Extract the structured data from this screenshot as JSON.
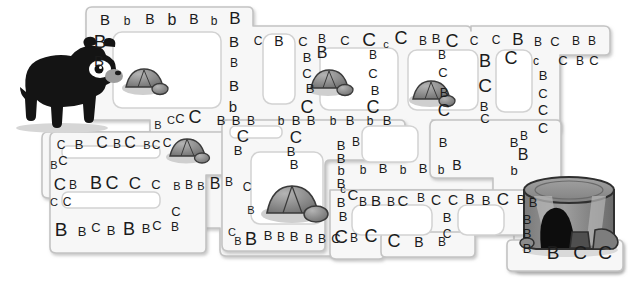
{
  "page": {
    "background_color": "#ffffff",
    "path_fill": "#f7f7f7",
    "path_stroke": "#bdbdbd",
    "letter_color": "#1b1b1b"
  },
  "figures": {
    "bear": {
      "name": "black-bear",
      "alt": "Black bear standing at the maze entrance on the left",
      "body_color": "#1a1a1a",
      "muzzle_color": "#9a9a9a",
      "shadow_color": "#cfcfcf"
    },
    "stump": {
      "name": "tree-stump-den",
      "alt": "Hollow tree stump den at the maze exit on the right",
      "top_color": "#8f8f8f",
      "side_color": "#6e6e6e",
      "hollow_color": "#111111",
      "light_color": "#b5b5b5"
    },
    "rocks": [
      {
        "name": "rock-1",
        "x": 126,
        "y": 70,
        "w": 40,
        "h": 26
      },
      {
        "name": "rock-2",
        "x": 170,
        "y": 138,
        "w": 38,
        "h": 25
      },
      {
        "name": "rock-3",
        "x": 311,
        "y": 70,
        "w": 40,
        "h": 27
      },
      {
        "name": "rock-4",
        "x": 413,
        "y": 81,
        "w": 40,
        "h": 27
      },
      {
        "name": "rock-5",
        "x": 268,
        "y": 180,
        "w": 58,
        "h": 39
      }
    ]
  },
  "letters": [
    {
      "t": "B",
      "x": 105,
      "y": 19,
      "s": 15
    },
    {
      "t": "b",
      "x": 127,
      "y": 21,
      "s": 12
    },
    {
      "t": "B",
      "x": 150,
      "y": 19,
      "s": 14
    },
    {
      "t": "b",
      "x": 172,
      "y": 20,
      "s": 16
    },
    {
      "t": "B",
      "x": 194,
      "y": 19,
      "s": 14
    },
    {
      "t": "b",
      "x": 214,
      "y": 21,
      "s": 12
    },
    {
      "t": "B",
      "x": 235,
      "y": 18,
      "s": 17
    },
    {
      "t": "B",
      "x": 100,
      "y": 41,
      "s": 19
    },
    {
      "t": "B",
      "x": 99,
      "y": 60,
      "s": 15
    },
    {
      "t": "B",
      "x": 234,
      "y": 41,
      "s": 15
    },
    {
      "t": "B",
      "x": 234,
      "y": 63,
      "s": 12
    },
    {
      "t": "B",
      "x": 234,
      "y": 85,
      "s": 15
    },
    {
      "t": "b",
      "x": 233,
      "y": 106,
      "s": 15
    },
    {
      "t": "C",
      "x": 258,
      "y": 41,
      "s": 12
    },
    {
      "t": "B",
      "x": 279,
      "y": 41,
      "s": 14
    },
    {
      "t": "C",
      "x": 303,
      "y": 41,
      "s": 13
    },
    {
      "t": "B",
      "x": 322,
      "y": 39,
      "s": 12
    },
    {
      "t": "B",
      "x": 322,
      "y": 53,
      "s": 16
    },
    {
      "t": "C",
      "x": 345,
      "y": 40,
      "s": 13
    },
    {
      "t": "C",
      "x": 369,
      "y": 39,
      "s": 19
    },
    {
      "t": "c",
      "x": 386,
      "y": 44,
      "s": 11
    },
    {
      "t": "C",
      "x": 401,
      "y": 38,
      "s": 18
    },
    {
      "t": "B",
      "x": 423,
      "y": 41,
      "s": 12
    },
    {
      "t": "B",
      "x": 436,
      "y": 38,
      "s": 13
    },
    {
      "t": "C",
      "x": 452,
      "y": 41,
      "s": 18
    },
    {
      "t": "B",
      "x": 442,
      "y": 55,
      "s": 12
    },
    {
      "t": "C",
      "x": 443,
      "y": 72,
      "s": 13
    },
    {
      "t": "B",
      "x": 444,
      "y": 92,
      "s": 13
    },
    {
      "t": "C",
      "x": 444,
      "y": 110,
      "s": 17
    },
    {
      "t": "C",
      "x": 474,
      "y": 41,
      "s": 12
    },
    {
      "t": "C",
      "x": 496,
      "y": 40,
      "s": 12
    },
    {
      "t": "B",
      "x": 518,
      "y": 39,
      "s": 17
    },
    {
      "t": "B",
      "x": 538,
      "y": 42,
      "s": 12
    },
    {
      "t": "C",
      "x": 555,
      "y": 41,
      "s": 13
    },
    {
      "t": "B",
      "x": 576,
      "y": 41,
      "s": 12
    },
    {
      "t": "B",
      "x": 592,
      "y": 41,
      "s": 12
    },
    {
      "t": "B",
      "x": 485,
      "y": 61,
      "s": 18
    },
    {
      "t": "C",
      "x": 511,
      "y": 58,
      "s": 18
    },
    {
      "t": "c",
      "x": 536,
      "y": 61,
      "s": 12
    },
    {
      "t": "C",
      "x": 563,
      "y": 60,
      "s": 13
    },
    {
      "t": "B",
      "x": 580,
      "y": 61,
      "s": 12
    },
    {
      "t": "C",
      "x": 594,
      "y": 60,
      "s": 13
    },
    {
      "t": "C",
      "x": 485,
      "y": 85,
      "s": 19
    },
    {
      "t": "B",
      "x": 484,
      "y": 106,
      "s": 13
    },
    {
      "t": "C",
      "x": 485,
      "y": 118,
      "s": 13
    },
    {
      "t": "B",
      "x": 543,
      "y": 75,
      "s": 13
    },
    {
      "t": "C",
      "x": 543,
      "y": 93,
      "s": 13
    },
    {
      "t": "C",
      "x": 543,
      "y": 110,
      "s": 14
    },
    {
      "t": "C",
      "x": 543,
      "y": 128,
      "s": 14
    },
    {
      "t": "B",
      "x": 307,
      "y": 57,
      "s": 13
    },
    {
      "t": "C",
      "x": 307,
      "y": 73,
      "s": 13
    },
    {
      "t": "B",
      "x": 310,
      "y": 88,
      "s": 13
    },
    {
      "t": "C",
      "x": 307,
      "y": 107,
      "s": 18
    },
    {
      "t": "B",
      "x": 373,
      "y": 55,
      "s": 12
    },
    {
      "t": "C",
      "x": 373,
      "y": 73,
      "s": 13
    },
    {
      "t": "B",
      "x": 375,
      "y": 90,
      "s": 13
    },
    {
      "t": "C",
      "x": 373,
      "y": 107,
      "s": 18
    },
    {
      "t": "B",
      "x": 158,
      "y": 125,
      "s": 11
    },
    {
      "t": "C",
      "x": 171,
      "y": 120,
      "s": 11
    },
    {
      "t": "C",
      "x": 180,
      "y": 118,
      "s": 13
    },
    {
      "t": "C",
      "x": 195,
      "y": 117,
      "s": 18
    },
    {
      "t": "B",
      "x": 221,
      "y": 120,
      "s": 13
    },
    {
      "t": "B",
      "x": 236,
      "y": 120,
      "s": 13
    },
    {
      "t": "B",
      "x": 251,
      "y": 121,
      "s": 12
    },
    {
      "t": "b",
      "x": 281,
      "y": 121,
      "s": 12
    },
    {
      "t": "B",
      "x": 296,
      "y": 120,
      "s": 13
    },
    {
      "t": "B",
      "x": 311,
      "y": 120,
      "s": 13
    },
    {
      "t": "b",
      "x": 333,
      "y": 121,
      "s": 12
    },
    {
      "t": "B",
      "x": 350,
      "y": 120,
      "s": 13
    },
    {
      "t": "b",
      "x": 370,
      "y": 121,
      "s": 12
    },
    {
      "t": "B",
      "x": 387,
      "y": 120,
      "s": 13
    },
    {
      "t": "C",
      "x": 243,
      "y": 136,
      "s": 17
    },
    {
      "t": "B",
      "x": 238,
      "y": 150,
      "s": 13
    },
    {
      "t": "C",
      "x": 296,
      "y": 137,
      "s": 17
    },
    {
      "t": "B",
      "x": 291,
      "y": 151,
      "s": 13
    },
    {
      "t": "B",
      "x": 294,
      "y": 164,
      "s": 13
    },
    {
      "t": "C",
      "x": 61,
      "y": 145,
      "s": 12
    },
    {
      "t": "B",
      "x": 79,
      "y": 144,
      "s": 13
    },
    {
      "t": "C",
      "x": 102,
      "y": 143,
      "s": 16
    },
    {
      "t": "B",
      "x": 117,
      "y": 144,
      "s": 12
    },
    {
      "t": "C",
      "x": 130,
      "y": 143,
      "s": 16
    },
    {
      "t": "B",
      "x": 147,
      "y": 145,
      "s": 11
    },
    {
      "t": "C",
      "x": 156,
      "y": 145,
      "s": 12
    },
    {
      "t": "C",
      "x": 167,
      "y": 143,
      "s": 12
    },
    {
      "t": "B",
      "x": 54,
      "y": 165,
      "s": 11
    },
    {
      "t": "C",
      "x": 63,
      "y": 160,
      "s": 13
    },
    {
      "t": "C",
      "x": 60,
      "y": 184,
      "s": 17
    },
    {
      "t": "B",
      "x": 73,
      "y": 185,
      "s": 12
    },
    {
      "t": "B",
      "x": 96,
      "y": 183,
      "s": 18
    },
    {
      "t": "C",
      "x": 112,
      "y": 183,
      "s": 18
    },
    {
      "t": "C",
      "x": 135,
      "y": 183,
      "s": 17
    },
    {
      "t": "C",
      "x": 156,
      "y": 184,
      "s": 13
    },
    {
      "t": "B",
      "x": 177,
      "y": 186,
      "s": 11
    },
    {
      "t": "B",
      "x": 189,
      "y": 185,
      "s": 12
    },
    {
      "t": "B",
      "x": 201,
      "y": 186,
      "s": 11
    },
    {
      "t": "B",
      "x": 215,
      "y": 184,
      "s": 16
    },
    {
      "t": "B",
      "x": 229,
      "y": 182,
      "s": 12
    },
    {
      "t": "C",
      "x": 247,
      "y": 187,
      "s": 12
    },
    {
      "t": "C",
      "x": 54,
      "y": 202,
      "s": 11
    },
    {
      "t": "C",
      "x": 67,
      "y": 202,
      "s": 12
    },
    {
      "t": "B",
      "x": 61,
      "y": 229,
      "s": 19
    },
    {
      "t": "B",
      "x": 82,
      "y": 231,
      "s": 13
    },
    {
      "t": "C",
      "x": 96,
      "y": 227,
      "s": 13
    },
    {
      "t": "B",
      "x": 111,
      "y": 230,
      "s": 13
    },
    {
      "t": "B",
      "x": 129,
      "y": 229,
      "s": 18
    },
    {
      "t": "B",
      "x": 146,
      "y": 228,
      "s": 13
    },
    {
      "t": "C",
      "x": 157,
      "y": 225,
      "s": 13
    },
    {
      "t": "C",
      "x": 176,
      "y": 211,
      "s": 13
    },
    {
      "t": "B",
      "x": 175,
      "y": 227,
      "s": 12
    },
    {
      "t": "B",
      "x": 251,
      "y": 210,
      "s": 11
    },
    {
      "t": "C",
      "x": 232,
      "y": 232,
      "s": 11
    },
    {
      "t": "B",
      "x": 238,
      "y": 241,
      "s": 11
    },
    {
      "t": "B",
      "x": 251,
      "y": 239,
      "s": 18
    },
    {
      "t": "B",
      "x": 268,
      "y": 235,
      "s": 13
    },
    {
      "t": "B",
      "x": 281,
      "y": 237,
      "s": 12
    },
    {
      "t": "B",
      "x": 294,
      "y": 236,
      "s": 13
    },
    {
      "t": "B",
      "x": 309,
      "y": 239,
      "s": 12
    },
    {
      "t": "B",
      "x": 322,
      "y": 239,
      "s": 12
    },
    {
      "t": "C",
      "x": 336,
      "y": 238,
      "s": 13
    },
    {
      "t": "B",
      "x": 354,
      "y": 238,
      "s": 12
    },
    {
      "t": "C",
      "x": 371,
      "y": 236,
      "s": 18
    },
    {
      "t": "B",
      "x": 341,
      "y": 145,
      "s": 13
    },
    {
      "t": "B",
      "x": 356,
      "y": 142,
      "s": 12
    },
    {
      "t": "B",
      "x": 341,
      "y": 158,
      "s": 13
    },
    {
      "t": "b",
      "x": 341,
      "y": 170,
      "s": 13
    },
    {
      "t": "B",
      "x": 341,
      "y": 183,
      "s": 13
    },
    {
      "t": "b",
      "x": 363,
      "y": 170,
      "s": 12
    },
    {
      "t": "B",
      "x": 383,
      "y": 168,
      "s": 13
    },
    {
      "t": "b",
      "x": 403,
      "y": 170,
      "s": 12
    },
    {
      "t": "B",
      "x": 423,
      "y": 168,
      "s": 13
    },
    {
      "t": "b",
      "x": 441,
      "y": 170,
      "s": 12
    },
    {
      "t": "B",
      "x": 457,
      "y": 165,
      "s": 14
    },
    {
      "t": "B",
      "x": 443,
      "y": 142,
      "s": 13
    },
    {
      "t": "B",
      "x": 514,
      "y": 142,
      "s": 13
    },
    {
      "t": "B",
      "x": 524,
      "y": 136,
      "s": 12
    },
    {
      "t": "B",
      "x": 523,
      "y": 155,
      "s": 16
    },
    {
      "t": "b",
      "x": 514,
      "y": 170,
      "s": 13
    },
    {
      "t": "c",
      "x": 343,
      "y": 189,
      "s": 11
    },
    {
      "t": "C",
      "x": 353,
      "y": 194,
      "s": 15
    },
    {
      "t": "B",
      "x": 341,
      "y": 202,
      "s": 13
    },
    {
      "t": "B",
      "x": 343,
      "y": 216,
      "s": 13
    },
    {
      "t": "C",
      "x": 341,
      "y": 236,
      "s": 19
    },
    {
      "t": "B",
      "x": 363,
      "y": 202,
      "s": 12
    },
    {
      "t": "B",
      "x": 376,
      "y": 200,
      "s": 15
    },
    {
      "t": "B",
      "x": 391,
      "y": 202,
      "s": 12
    },
    {
      "t": "C",
      "x": 403,
      "y": 200,
      "s": 15
    },
    {
      "t": "B",
      "x": 421,
      "y": 198,
      "s": 12
    },
    {
      "t": "C",
      "x": 436,
      "y": 200,
      "s": 14
    },
    {
      "t": "C",
      "x": 453,
      "y": 200,
      "s": 14
    },
    {
      "t": "B",
      "x": 470,
      "y": 199,
      "s": 14
    },
    {
      "t": "B",
      "x": 486,
      "y": 200,
      "s": 13
    },
    {
      "t": "C",
      "x": 503,
      "y": 199,
      "s": 17
    },
    {
      "t": "B",
      "x": 521,
      "y": 199,
      "s": 13
    },
    {
      "t": "B",
      "x": 533,
      "y": 202,
      "s": 13
    },
    {
      "t": "B",
      "x": 447,
      "y": 217,
      "s": 13
    },
    {
      "t": "C",
      "x": 447,
      "y": 234,
      "s": 12
    },
    {
      "t": "C",
      "x": 394,
      "y": 241,
      "s": 18
    },
    {
      "t": "B",
      "x": 419,
      "y": 242,
      "s": 14
    },
    {
      "t": "B",
      "x": 442,
      "y": 242,
      "s": 12
    },
    {
      "t": "B",
      "x": 527,
      "y": 219,
      "s": 13
    },
    {
      "t": "B",
      "x": 527,
      "y": 233,
      "s": 13
    },
    {
      "t": "B",
      "x": 527,
      "y": 248,
      "s": 13
    },
    {
      "t": "B",
      "x": 553,
      "y": 252,
      "s": 19
    },
    {
      "t": "C",
      "x": 580,
      "y": 252,
      "s": 19
    },
    {
      "t": "C",
      "x": 605,
      "y": 252,
      "s": 19
    }
  ]
}
